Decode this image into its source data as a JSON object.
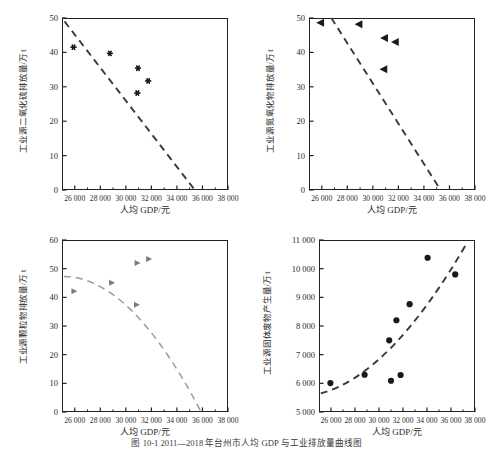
{
  "caption": "图 10-1  2011—2018 年台州市人均 GDP 与工业排放量曲线图",
  "axis_labels": {
    "x": "人均 GDP/元"
  },
  "chart_data": [
    {
      "type": "scatter",
      "panel": "top-left",
      "title": "",
      "xlabel": "人均 GDP/元",
      "ylabel": "工业源二氧化硫排放量/万 t",
      "xlim": [
        25000,
        38000
      ],
      "ylim": [
        0,
        50
      ],
      "xticks": [
        "26 000",
        "28 000",
        "30 000",
        "32 000",
        "34 000",
        "36 000",
        "38 000"
      ],
      "xtickvals": [
        26000,
        28000,
        30000,
        32000,
        34000,
        36000,
        38000
      ],
      "yticks": [
        "0",
        "10",
        "20",
        "30",
        "40",
        "50"
      ],
      "ytickvals": [
        0,
        10,
        20,
        30,
        40,
        50
      ],
      "marker": "star",
      "grid": false,
      "legend": false,
      "points": [
        {
          "x": 25900,
          "y": 41.5
        },
        {
          "x": 28750,
          "y": 39.7
        },
        {
          "x": 30950,
          "y": 35.4
        },
        {
          "x": 31750,
          "y": 31.7
        },
        {
          "x": 30900,
          "y": 28.2
        }
      ],
      "trend": {
        "style": "dashed",
        "kind": "linear",
        "from": {
          "x": 25200,
          "y": 49.0
        },
        "to": {
          "x": 35400,
          "y": 0.0
        }
      }
    },
    {
      "type": "scatter",
      "panel": "top-right",
      "title": "",
      "xlabel": "人均 GDP/元",
      "ylabel": "工业源氮氧化物排放量/万 t",
      "xlim": [
        25000,
        38000
      ],
      "ylim": [
        0,
        50
      ],
      "xticks": [
        "26 000",
        "28 000",
        "30 000",
        "32 000",
        "34 000",
        "36 000",
        "38 000"
      ],
      "xtickvals": [
        26000,
        28000,
        30000,
        32000,
        34000,
        36000,
        38000
      ],
      "yticks": [
        "0",
        "10",
        "20",
        "30",
        "40",
        "50"
      ],
      "ytickvals": [
        0,
        10,
        20,
        30,
        40,
        50
      ],
      "marker": "triangle-left",
      "grid": false,
      "legend": false,
      "points": [
        {
          "x": 25900,
          "y": 48.6
        },
        {
          "x": 28900,
          "y": 48.2
        },
        {
          "x": 30900,
          "y": 44.2
        },
        {
          "x": 31750,
          "y": 43.0
        },
        {
          "x": 30850,
          "y": 35.1
        }
      ],
      "trend": {
        "style": "dashed",
        "kind": "linear",
        "from": {
          "x": 26750,
          "y": 50.0
        },
        "to": {
          "x": 35300,
          "y": 0.0
        }
      }
    },
    {
      "type": "scatter",
      "panel": "bottom-left",
      "title": "",
      "xlabel": "人均 GDP/元",
      "ylabel": "工业源颗粒物排放量/万 t",
      "xlim": [
        25000,
        38000
      ],
      "ylim": [
        0,
        60
      ],
      "xticks": [
        "26 000",
        "28 000",
        "30 000",
        "32 000",
        "34 000",
        "36 000",
        "38 000"
      ],
      "xtickvals": [
        26000,
        28000,
        30000,
        32000,
        34000,
        36000,
        38000
      ],
      "yticks": [
        "0",
        "10",
        "20",
        "30",
        "40",
        "50",
        "60"
      ],
      "ytickvals": [
        0,
        10,
        20,
        30,
        40,
        50,
        60
      ],
      "marker": "triangle-right",
      "grid": false,
      "legend": false,
      "points": [
        {
          "x": 25950,
          "y": 42.1
        },
        {
          "x": 28900,
          "y": 45.1
        },
        {
          "x": 30900,
          "y": 52.0
        },
        {
          "x": 31800,
          "y": 53.4
        },
        {
          "x": 30850,
          "y": 37.4
        }
      ],
      "trend": {
        "style": "dashed",
        "kind": "quadratic",
        "p0": {
          "x": 25150,
          "y": 47.3
        },
        "p1": {
          "x": 30400,
          "y": 47.0
        },
        "p2": {
          "x": 35900,
          "y": 0.0
        }
      }
    },
    {
      "type": "scatter",
      "panel": "bottom-right",
      "title": "",
      "xlabel": "人均 GDP/元",
      "ylabel": "工业源固体废物产生量/万 t",
      "xlim": [
        25000,
        38000
      ],
      "ylim": [
        5000,
        11000
      ],
      "xticks": [
        "26 000",
        "28 000",
        "30 000",
        "32 000",
        "34 000",
        "36 000",
        "38 000"
      ],
      "xtickvals": [
        26000,
        28000,
        30000,
        32000,
        34000,
        36000,
        38000
      ],
      "yticks": [
        "5 000",
        "6 000",
        "7 000",
        "8 000",
        "9 000",
        "10 000",
        "11 000"
      ],
      "ytickvals": [
        5000,
        6000,
        7000,
        8000,
        9000,
        10000,
        11000
      ],
      "marker": "circle",
      "grid": false,
      "legend": false,
      "points": [
        {
          "x": 25950,
          "y": 6010
        },
        {
          "x": 28800,
          "y": 6300
        },
        {
          "x": 30850,
          "y": 7500
        },
        {
          "x": 31450,
          "y": 8200
        },
        {
          "x": 31000,
          "y": 6090
        },
        {
          "x": 31800,
          "y": 6290
        },
        {
          "x": 32550,
          "y": 8760
        },
        {
          "x": 34050,
          "y": 10380
        },
        {
          "x": 36350,
          "y": 9800
        }
      ],
      "trend": {
        "style": "dashed",
        "kind": "quadratic",
        "p0": {
          "x": 25150,
          "y": 5650
        },
        "p1": {
          "x": 31000,
          "y": 6300
        },
        "p2": {
          "x": 37400,
          "y": 10950
        }
      }
    }
  ]
}
